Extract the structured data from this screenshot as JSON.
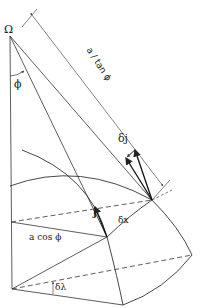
{
  "diagram": {
    "labels": {
      "omega": "Ω",
      "phi_angle": "ϕ",
      "dimension": "a / tan ϕ",
      "delta_j": "δj",
      "unit_j": "j",
      "delta_x": "δx",
      "radius": "a cos ϕ",
      "delta_lambda": "δλ"
    },
    "colors": {
      "line": "#333333",
      "background": "#ffffff"
    }
  }
}
